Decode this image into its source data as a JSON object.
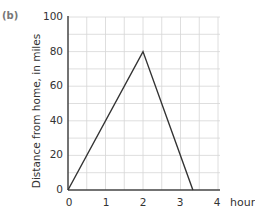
{
  "panel_label": "(b)",
  "chart_data": {
    "type": "line",
    "title": "",
    "xlabel": "hours",
    "ylabel": "Distance from home, in miles",
    "xlim": [
      0,
      4
    ],
    "ylim": [
      0,
      100
    ],
    "x_ticks": [
      "0",
      "1",
      "2",
      "3",
      "4"
    ],
    "y_ticks": [
      "0",
      "20",
      "40",
      "60",
      "80",
      "100"
    ],
    "grid": true,
    "grid_minor_x": 0.5,
    "grid_minor_y": 10,
    "series": [
      {
        "name": "distance",
        "x": [
          0,
          2,
          3.33
        ],
        "y": [
          0,
          80,
          0
        ]
      }
    ]
  },
  "colors": {
    "line": "#333333",
    "grid": "#d6d6d6",
    "axis": "#444444"
  }
}
